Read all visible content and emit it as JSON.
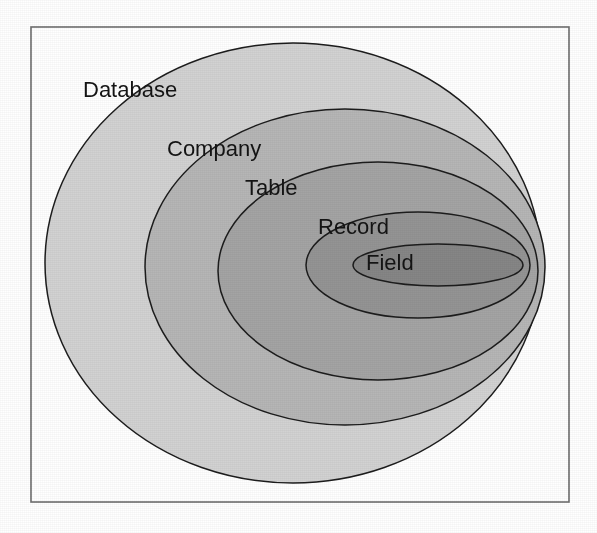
{
  "figure": {
    "kind": "nested-ellipse-containment-diagram",
    "background_color": "#ffffff",
    "frame": {
      "name": "figure-border",
      "x": 31,
      "y": 27,
      "width": 538,
      "height": 475,
      "stroke_color": "#6e6e6e",
      "stroke_width": 1.6,
      "fill": "none"
    },
    "outline_color": "#1c1c1c",
    "outline_width": 1.5,
    "label_color": "#141414",
    "label_font_size": 22
  },
  "levels": [
    {
      "id": "database",
      "label": "Database",
      "depth": 1,
      "fill_color": "#d2d2d2",
      "ellipse": {
        "cx": 293,
        "cy": 263,
        "rx": 248,
        "ry": 220
      },
      "label_pos": {
        "x": 83,
        "y": 91
      }
    },
    {
      "id": "company",
      "label": "Company",
      "depth": 2,
      "fill_color": "#b6b6b6",
      "ellipse": {
        "cx": 345,
        "cy": 267,
        "rx": 200,
        "ry": 158
      },
      "label_pos": {
        "x": 167,
        "y": 150
      }
    },
    {
      "id": "table",
      "label": "Table",
      "depth": 3,
      "fill_color": "#a4a4a4",
      "ellipse": {
        "cx": 378,
        "cy": 271,
        "rx": 160,
        "ry": 109
      },
      "label_pos": {
        "x": 245,
        "y": 189
      }
    },
    {
      "id": "record",
      "label": "Record",
      "depth": 4,
      "fill_color": "#949494",
      "ellipse": {
        "cx": 418,
        "cy": 265,
        "rx": 112,
        "ry": 53
      },
      "label_pos": {
        "x": 318,
        "y": 228
      }
    },
    {
      "id": "field",
      "label": "Field",
      "depth": 5,
      "fill_color": "#868686",
      "ellipse": {
        "cx": 438,
        "cy": 265,
        "rx": 85,
        "ry": 21
      },
      "label_pos": {
        "x": 366,
        "y": 264
      }
    }
  ]
}
